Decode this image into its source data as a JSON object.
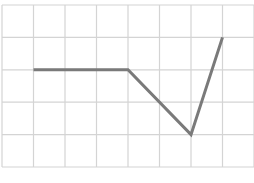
{
  "chart_data": {
    "type": "line",
    "title": "",
    "xlabel": "",
    "ylabel": "",
    "grid": true,
    "grid_cols": 8,
    "grid_rows": 5,
    "xlim": [
      0,
      8
    ],
    "ylim": [
      0,
      5
    ],
    "series": [
      {
        "name": "line",
        "x": [
          1,
          4,
          6,
          7
        ],
        "values": [
          3,
          3,
          1,
          4
        ]
      }
    ],
    "legend": null
  },
  "colors": {
    "grid": "#d4d4d4",
    "line": "#7a7a7a",
    "background": "#ffffff"
  }
}
